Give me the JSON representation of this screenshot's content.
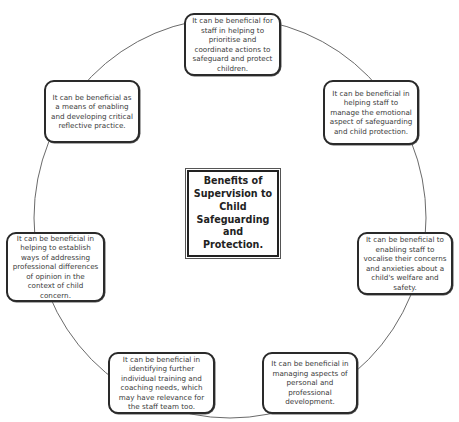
{
  "diagram": {
    "type": "cycle",
    "center": {
      "label": "Benefits of Supervision to Child Safeguarding and Protection."
    },
    "nodes": [
      {
        "position": "top",
        "text": "It can be beneficial for staff in helping to prioritise and coordinate actions to safeguard and protect children."
      },
      {
        "position": "top-right",
        "text": "It can be beneficial in helping staff to manage the emotional aspect of safeguarding and child protection."
      },
      {
        "position": "right",
        "text": "It can be beneficial to enabling staff to vocalise their concerns and anxieties about a child's welfare and safety."
      },
      {
        "position": "bottom-right",
        "text": "It can be beneficial in managing aspects of personal and professional development."
      },
      {
        "position": "bottom-left",
        "text": "It can be beneficial in identifying further individual training and coaching needs, which may have relevance for the staff team too."
      },
      {
        "position": "left",
        "text": "It can be beneficial in helping to establish ways of addressing professional differences of opinion in the context of child concern."
      },
      {
        "position": "top-left",
        "text": "It can be beneficial as a means of enabling and developing critical reflective practice."
      }
    ],
    "colors": {
      "border": "#2a2a2a",
      "text": "#3a3a3a",
      "connector": "#666666",
      "background": "#ffffff"
    }
  }
}
